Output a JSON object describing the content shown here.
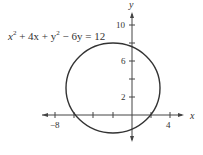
{
  "diagram": {
    "equation": {
      "lhs_parts": [
        "x",
        "2",
        " + 4x + y",
        "2",
        " − 6y = 12"
      ]
    },
    "axes": {
      "x_label": "x",
      "y_label": "y"
    },
    "x_ticks": [
      {
        "value": -8,
        "label": "−8"
      },
      {
        "value": 4,
        "label": "4"
      }
    ],
    "y_ticks": [
      {
        "value": 2,
        "label": "2"
      },
      {
        "value": 6,
        "label": "6"
      },
      {
        "value": 10,
        "label": "10"
      }
    ],
    "circle": {
      "center": [
        -2,
        3
      ],
      "radius": 5
    },
    "colors": {
      "stroke": "#333333"
    }
  }
}
